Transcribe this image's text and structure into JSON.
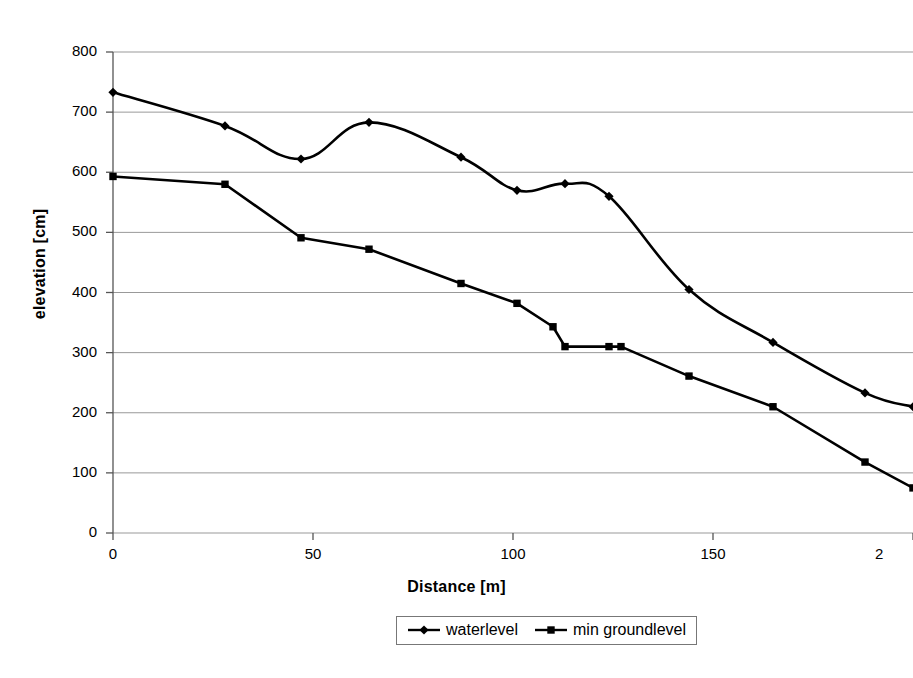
{
  "chart_data": {
    "type": "line",
    "title": "",
    "xlabel": "Distance [m]",
    "ylabel": "elevation [cm]",
    "xlim": [
      0,
      200
    ],
    "ylim": [
      0,
      800
    ],
    "xticks": [
      0,
      50,
      100,
      150,
      200
    ],
    "xtick_labels": [
      "0",
      "50",
      "100",
      "150",
      "2"
    ],
    "yticks": [
      0,
      100,
      200,
      300,
      400,
      500,
      600,
      700,
      800
    ],
    "ytick_labels": [
      "0",
      "100",
      "200",
      "300",
      "400",
      "500",
      "600",
      "700",
      "800"
    ],
    "grid": "horizontal",
    "legend_position": "bottom",
    "line_color": "#000000",
    "grid_color": "#999999",
    "smoothing": "spline",
    "series": [
      {
        "name": "waterlevel",
        "marker": "diamond",
        "color": "#000000",
        "x": [
          0,
          28,
          47,
          64,
          87,
          101,
          113,
          124,
          144,
          165,
          188,
          200
        ],
        "y": [
          733,
          677,
          622,
          683,
          625,
          570,
          581,
          560,
          405,
          317,
          233,
          210
        ]
      },
      {
        "name": "min groundlevel",
        "marker": "square",
        "color": "#000000",
        "x": [
          0,
          28,
          47,
          64,
          87,
          101,
          110,
          113,
          124,
          127,
          144,
          165,
          188,
          200
        ],
        "y": [
          593,
          580,
          491,
          472,
          415,
          382,
          343,
          310,
          310,
          310,
          261,
          210,
          118,
          75
        ]
      }
    ]
  },
  "legend": {
    "items": [
      {
        "label": "waterlevel",
        "marker": "diamond"
      },
      {
        "label": "min groundlevel",
        "marker": "square"
      }
    ]
  }
}
